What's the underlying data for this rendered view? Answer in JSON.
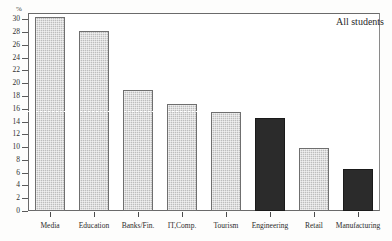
{
  "chart_data": {
    "type": "bar",
    "title": "",
    "subtitle": "",
    "annotation": "All students",
    "xlabel": "",
    "ylabel": "%",
    "ylim": [
      0,
      31
    ],
    "ytick_step": 2,
    "yticks": [
      0,
      2,
      4,
      6,
      8,
      10,
      12,
      14,
      16,
      18,
      20,
      22,
      24,
      26,
      28,
      30
    ],
    "ytick_labels": [
      "0",
      "2",
      "4",
      "6",
      "8",
      "10",
      "12",
      "14",
      "16",
      "18",
      "20",
      "22",
      "24",
      "26",
      "28",
      "30"
    ],
    "grid": false,
    "legend_position": "top-right",
    "reference_line": {
      "value": 15.7,
      "style": "dotted",
      "color": "#ffffff"
    },
    "categories": [
      "Media",
      "Education",
      "Banks/Fin.",
      "IT,Comp.",
      "Tourism",
      "Engineering",
      "Retail",
      "Manufacturing"
    ],
    "values": [
      30.4,
      28.2,
      19.0,
      16.8,
      15.5,
      14.5,
      9.8,
      6.5
    ],
    "bar_styles": [
      "light",
      "light",
      "light",
      "light",
      "light",
      "dark",
      "light",
      "dark"
    ],
    "colors": {
      "light_bar": "#bdbdbd",
      "dark_bar": "#2b2b2b",
      "bar_border": "#6f6f6f",
      "axis": "#5a5a5a",
      "text": "#2b2b2b",
      "background": "#ffffff",
      "reference_line": "#ffffff"
    }
  }
}
